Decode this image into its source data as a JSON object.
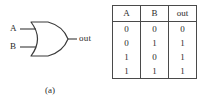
{
  "figure": {
    "panel_a": {
      "caption": "(a)",
      "gate_type": "or-gate",
      "input_labels": [
        "A",
        "B"
      ],
      "output_label": "out"
    },
    "panel_b": {
      "caption": "(b)",
      "table": {
        "headers": [
          "A",
          "B",
          "out"
        ],
        "rows": [
          [
            "0",
            "0",
            "0"
          ],
          [
            "0",
            "1",
            "1"
          ],
          [
            "1",
            "0",
            "1"
          ],
          [
            "1",
            "1",
            "1"
          ]
        ]
      }
    }
  },
  "colors": {
    "background": "#ffffff",
    "ink": "#2b2b2b",
    "rule": "#4a4a4a"
  }
}
